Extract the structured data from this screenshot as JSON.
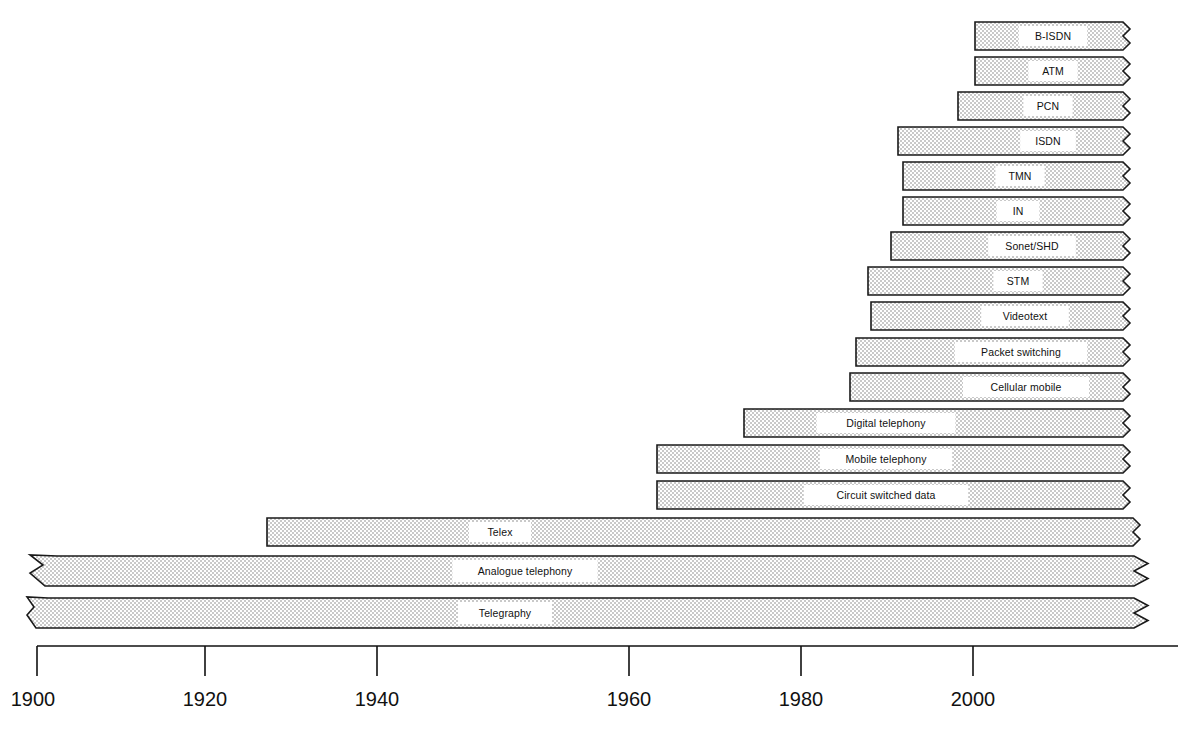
{
  "figure": {
    "type": "timeline-gantt",
    "cut_off_header": "",
    "background": "#ffffff",
    "bar_fill": "#d9d9d9",
    "bar_stroke": "#1a1a1a",
    "label_box_fill": "#ffffff"
  },
  "axis": {
    "orientation": "horizontal-bottom",
    "label": "",
    "min": 1900,
    "max": 2010,
    "px_per_year": 8.6,
    "origin_px": 33,
    "ticks": [
      {
        "value": "1900",
        "x": 33
      },
      {
        "value": "1920",
        "x": 205
      },
      {
        "value": "1940",
        "x": 377
      },
      {
        "value": "1960",
        "x": 629
      },
      {
        "value": "1980",
        "x": 801
      },
      {
        "value": "2000",
        "x": 973
      }
    ]
  },
  "chart_data": {
    "type": "bar",
    "title": "",
    "xlabel": "",
    "ylabel": "",
    "xlim": [
      1900,
      2012
    ],
    "grid": false,
    "legend": null,
    "orientation": "horizontal",
    "note": "Horizontal timeline bars; all bars are open-ended to the right (torn/zigzag edge). Bottom two bars additionally extend left with an arrowhead (origin before 1900).",
    "categories": [
      "B-ISDN",
      "ATM",
      "PCN",
      "ISDN",
      "TMN",
      "IN",
      "Sonet/SHD",
      "STM",
      "Videotext",
      "Packet switching",
      "Cellular mobile",
      "Digital telephony",
      "Mobile telephony",
      "Circuit switched data",
      "Telex",
      "Analogue telephony",
      "Telegraphy"
    ],
    "bars": [
      {
        "label": "B-ISDN",
        "start_year": 1990,
        "end_year": 2012,
        "open_right": true,
        "arrow_left": false,
        "x0": 975,
        "x1": 1130,
        "y": 22,
        "h": 28,
        "label_x": 1053
      },
      {
        "label": "ATM",
        "start_year": 1990,
        "end_year": 2012,
        "open_right": true,
        "arrow_left": false,
        "x0": 975,
        "x1": 1130,
        "y": 57,
        "h": 28,
        "label_x": 1053
      },
      {
        "label": "PCN",
        "start_year": 1988,
        "end_year": 2012,
        "open_right": true,
        "arrow_left": false,
        "x0": 958,
        "x1": 1130,
        "y": 92,
        "h": 28,
        "label_x": 1048
      },
      {
        "label": "ISDN",
        "start_year": 1981,
        "end_year": 2012,
        "open_right": true,
        "arrow_left": false,
        "x0": 898,
        "x1": 1130,
        "y": 127,
        "h": 28,
        "label_x": 1048
      },
      {
        "label": "TMN",
        "start_year": 1982,
        "end_year": 2012,
        "open_right": true,
        "arrow_left": false,
        "x0": 903,
        "x1": 1130,
        "y": 162,
        "h": 28,
        "label_x": 1020
      },
      {
        "label": "IN",
        "start_year": 1982,
        "end_year": 2012,
        "open_right": true,
        "arrow_left": false,
        "x0": 903,
        "x1": 1130,
        "y": 197,
        "h": 28,
        "label_x": 1018
      },
      {
        "label": "Sonet/SHD",
        "start_year": 1980,
        "end_year": 2012,
        "open_right": true,
        "arrow_left": false,
        "x0": 891,
        "x1": 1130,
        "y": 232,
        "h": 28,
        "label_x": 1032
      },
      {
        "label": "STM",
        "start_year": 1977,
        "end_year": 2012,
        "open_right": true,
        "arrow_left": false,
        "x0": 868,
        "x1": 1130,
        "y": 267,
        "h": 28,
        "label_x": 1018
      },
      {
        "label": "Videotext",
        "start_year": 1978,
        "end_year": 2012,
        "open_right": true,
        "arrow_left": false,
        "x0": 871,
        "x1": 1130,
        "y": 302,
        "h": 28,
        "label_x": 1025
      },
      {
        "label": "Packet switching",
        "start_year": 1976,
        "end_year": 2012,
        "open_right": true,
        "arrow_left": false,
        "x0": 856,
        "x1": 1130,
        "y": 338,
        "h": 28,
        "label_x": 1021
      },
      {
        "label": "Cellular mobile",
        "start_year": 1975,
        "end_year": 2012,
        "open_right": true,
        "arrow_left": false,
        "x0": 850,
        "x1": 1130,
        "y": 373,
        "h": 28,
        "label_x": 1026
      },
      {
        "label": "Digital telephony",
        "start_year": 1963,
        "end_year": 2012,
        "open_right": true,
        "arrow_left": false,
        "x0": 744,
        "x1": 1130,
        "y": 409,
        "h": 28,
        "label_x": 886
      },
      {
        "label": "Mobile telephony",
        "start_year": 1953,
        "end_year": 2012,
        "open_right": true,
        "arrow_left": false,
        "x0": 657,
        "x1": 1130,
        "y": 445,
        "h": 28,
        "label_x": 886
      },
      {
        "label": "Circuit switched data",
        "start_year": 1953,
        "end_year": 2012,
        "open_right": true,
        "arrow_left": false,
        "x0": 657,
        "x1": 1130,
        "y": 481,
        "h": 28,
        "label_x": 886
      },
      {
        "label": "Telex",
        "start_year": 1927,
        "end_year": 2012,
        "open_right": true,
        "arrow_left": false,
        "x0": 267,
        "x1": 1140,
        "y": 518,
        "h": 28,
        "label_x": 500
      },
      {
        "label": "Analogue telephony",
        "start_year": 1893,
        "end_year": 2012,
        "open_right": true,
        "arrow_left": true,
        "x0": 57,
        "x1": 1148,
        "y": 556,
        "h": 30,
        "label_x": 525,
        "arrow_tip_x": 30
      },
      {
        "label": "Telegraphy",
        "start_year": 1891,
        "end_year": 2012,
        "open_right": true,
        "arrow_left": true,
        "x0": 48,
        "x1": 1148,
        "y": 598,
        "h": 30,
        "label_x": 505,
        "arrow_tip_x": 27
      }
    ]
  }
}
